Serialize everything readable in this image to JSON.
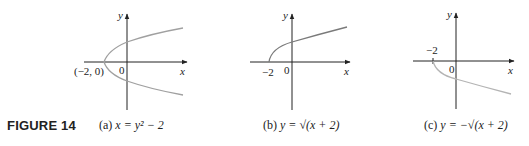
{
  "figure_label": "FIGURE 14",
  "panels": [
    {
      "id": "a",
      "caption_prefix": "(a)",
      "caption_equation": "x = y² − 2",
      "axis_x_label": "x",
      "axis_y_label": "y",
      "origin_label": "0",
      "point_label": "(−2, 0)",
      "curve_color": "#a0a0a0"
    },
    {
      "id": "b",
      "caption_prefix": "(b)",
      "caption_equation": "y = √(x + 2)",
      "axis_x_label": "x",
      "axis_y_label": "y",
      "origin_label": "0",
      "point_label": "−2",
      "curve_color": "#7a7a7a"
    },
    {
      "id": "c",
      "caption_prefix": "(c)",
      "caption_equation": "y = −√(x + 2)",
      "axis_x_label": "x",
      "axis_y_label": "y",
      "origin_label": "0",
      "point_label": "−2",
      "curve_color": "#b4b4b4"
    }
  ]
}
